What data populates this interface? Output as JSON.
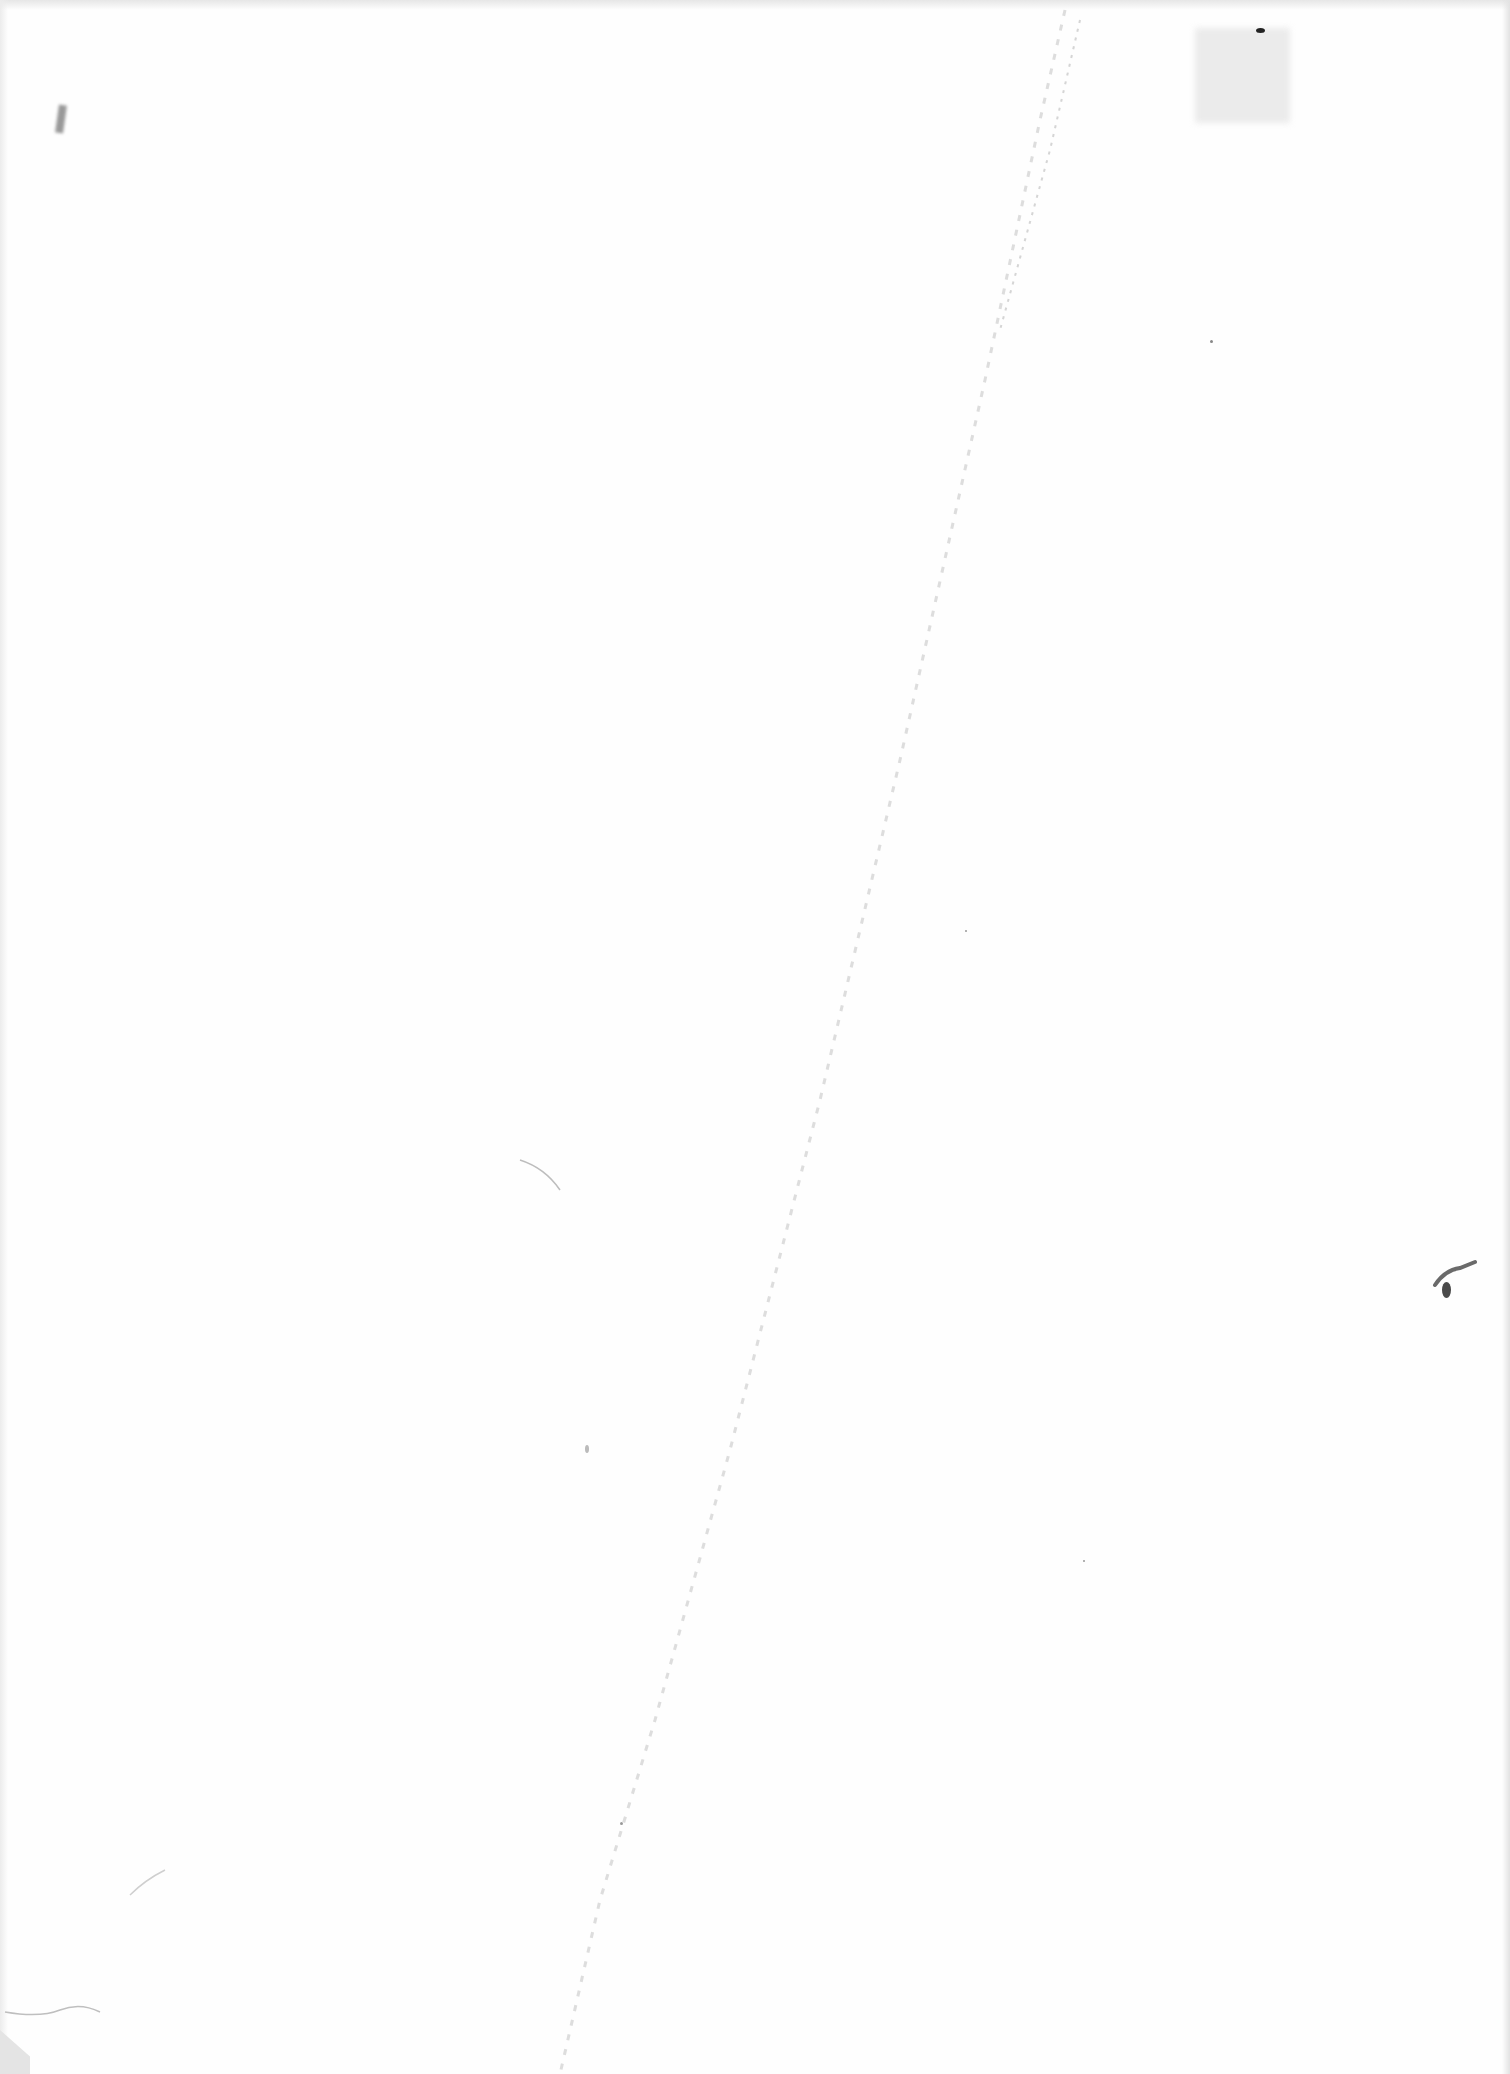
{
  "document": {
    "type": "scanned-page",
    "content": "",
    "background_color": "#ffffff",
    "artifacts": {
      "crease_color": "#c8c8c8",
      "ink_blot_color": "#555555"
    }
  }
}
